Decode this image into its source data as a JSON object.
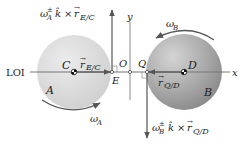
{
  "diagram": {
    "bodies": [
      {
        "name": "A",
        "center_label": "C",
        "contact_label": "E",
        "color": "#d9d9d9"
      },
      {
        "name": "B",
        "center_label": "D",
        "contact_label": "Q",
        "color": "#a8a8a8"
      }
    ],
    "axes": {
      "origin": "O",
      "x": "x",
      "y": "y",
      "line_label": "LOI"
    },
    "vectors": {
      "rEC": {
        "base": "r",
        "sub": "E/C"
      },
      "rQD": {
        "base": "r",
        "sub": "Q/D"
      },
      "velE": {
        "omega": "ω",
        "omega_sub": "A",
        "omega_sup": "±",
        "k": "k̂",
        "times": "×",
        "r": "r",
        "r_sub": "E/C"
      },
      "velQ": {
        "omega": "ω",
        "omega_sub": "B",
        "omega_sup": "±",
        "k": "k̂",
        "times": "×",
        "r": "r",
        "r_sub": "Q/D"
      }
    },
    "rotations": {
      "A": {
        "omega": "ω",
        "sub": "A"
      },
      "B": {
        "omega": "ω",
        "sub": "B"
      }
    },
    "colors": {
      "arrow": "#555555",
      "line": "#777777",
      "text": "#222222"
    }
  }
}
